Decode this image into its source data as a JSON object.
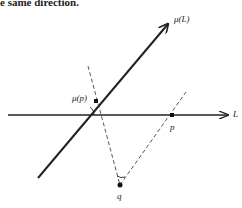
{
  "caption": "e same direction.",
  "diagram": {
    "labels": {
      "mu_L": "μ(L)",
      "mu_p": "μ(p)",
      "L": "L",
      "p": "p",
      "q": "q"
    },
    "colors": {
      "line": "#222222",
      "dashed": "#444444",
      "background": "#ffffff"
    },
    "elements": [
      {
        "type": "line-arrow",
        "name": "L",
        "from": [
          8,
          115
        ],
        "to": [
          228,
          115
        ]
      },
      {
        "type": "thick-line-arrow",
        "name": "mu(L)",
        "from": [
          38,
          178
        ],
        "to": [
          168,
          24
        ]
      },
      {
        "type": "point",
        "name": "mu(p)",
        "at": [
          96,
          101
        ]
      },
      {
        "type": "point",
        "name": "p",
        "at": [
          172,
          115
        ]
      },
      {
        "type": "point",
        "name": "q",
        "at": [
          120,
          185
        ]
      },
      {
        "type": "dashed-line",
        "from": [
          88,
          66
        ],
        "to": [
          120,
          185
        ]
      },
      {
        "type": "dashed-line",
        "from": [
          120,
          185
        ],
        "to": [
          186,
          92
        ]
      },
      {
        "type": "angle-arc",
        "at": "intersection of L and mu(L)"
      },
      {
        "type": "angle-arc",
        "at": "q"
      }
    ]
  }
}
